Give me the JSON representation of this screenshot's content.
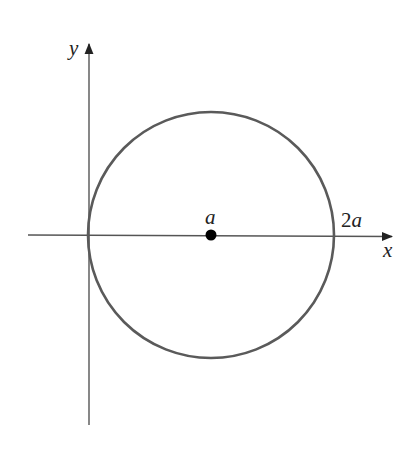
{
  "diagram": {
    "type": "circle-on-axes",
    "axes": {
      "x_label": "x",
      "y_label": "y",
      "axis_color": "#555555"
    },
    "circle": {
      "center_label": "a",
      "right_intercept_label": "2a",
      "stroke_color": "#5a5a5a",
      "center_point_color": "#000000"
    }
  }
}
